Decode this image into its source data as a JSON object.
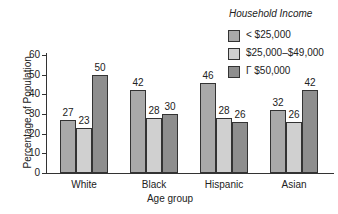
{
  "chart_data": {
    "type": "bar",
    "title": "",
    "xlabel": "Age group",
    "ylabel": "Percentage of Population",
    "ylim": [
      0,
      60
    ],
    "yticks": [
      0,
      10,
      20,
      30,
      40,
      50,
      60
    ],
    "categories": [
      "White",
      "Black",
      "Hispanic",
      "Asian"
    ],
    "legend_title": "Household Income",
    "legend_position": "top-right",
    "grid": false,
    "series": [
      {
        "name": "< $25,000",
        "color": "#a9a9a9",
        "values": [
          27,
          42,
          46,
          32
        ]
      },
      {
        "name": "$25,000–$49,000",
        "color": "#d0d0d0",
        "values": [
          23,
          28,
          28,
          26
        ]
      },
      {
        "name": "Γ $50,000",
        "color": "#8e8e8e",
        "values": [
          50,
          30,
          26,
          42
        ]
      }
    ]
  }
}
